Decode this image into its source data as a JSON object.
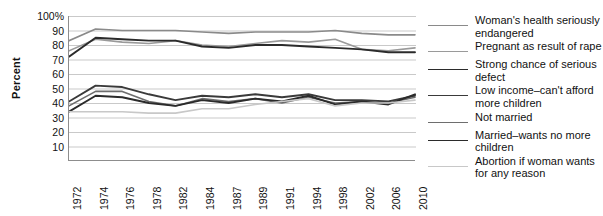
{
  "chart_data": {
    "type": "line",
    "title": "",
    "xlabel": "",
    "ylabel": "Percent",
    "ylim": [
      0,
      100
    ],
    "yticks": [
      "10",
      "20",
      "30",
      "40",
      "50",
      "60",
      "70",
      "80",
      "90",
      "100%"
    ],
    "ytick_values": [
      10,
      20,
      30,
      40,
      50,
      60,
      70,
      80,
      90,
      100
    ],
    "grid": true,
    "legend_position": "right",
    "categories": [
      "1972",
      "1974",
      "1976",
      "1978",
      "1982",
      "1984",
      "1987",
      "1989",
      "1991",
      "1994",
      "1998",
      "2002",
      "2006",
      "2010"
    ],
    "series": [
      {
        "name": "Woman's health seriously endangered",
        "color": "#8a8a8a",
        "width": 1.6,
        "values": [
          83,
          91,
          90,
          90,
          90,
          89,
          88,
          89,
          89,
          89,
          90,
          88,
          87,
          87
        ]
      },
      {
        "name": "Pregnant as result of rape",
        "color": "#9a9a9a",
        "width": 1.6,
        "values": [
          76,
          84,
          82,
          81,
          83,
          80,
          79,
          81,
          83,
          82,
          84,
          77,
          76,
          78
        ]
      },
      {
        "name": "Strong chance of serious defect",
        "color": "#2b2b2b",
        "width": 1.9,
        "values": [
          72,
          85,
          84,
          83,
          83,
          79,
          78,
          80,
          80,
          79,
          78,
          77,
          75,
          75
        ]
      },
      {
        "name": "Low income–can't afford more children",
        "color": "#3a3a3a",
        "width": 1.9,
        "values": [
          41,
          52,
          51,
          46,
          42,
          45,
          44,
          46,
          44,
          46,
          42,
          42,
          41,
          45
        ]
      },
      {
        "name": "Not married",
        "color": "#6e6e6e",
        "width": 1.6,
        "values": [
          38,
          48,
          48,
          41,
          38,
          43,
          41,
          43,
          40,
          44,
          40,
          41,
          40,
          44
        ]
      },
      {
        "name": "Married–wants no more children",
        "color": "#2b2b2b",
        "width": 1.9,
        "values": [
          34,
          45,
          44,
          40,
          38,
          42,
          40,
          43,
          41,
          45,
          39,
          41,
          39,
          46
        ]
      },
      {
        "name": "Abortion if woman wants for any reason",
        "color": "#c8c8c8",
        "width": 1.6,
        "values": [
          34,
          34,
          34,
          33,
          33,
          36,
          36,
          39,
          41,
          43,
          38,
          40,
          40,
          42
        ]
      }
    ]
  }
}
